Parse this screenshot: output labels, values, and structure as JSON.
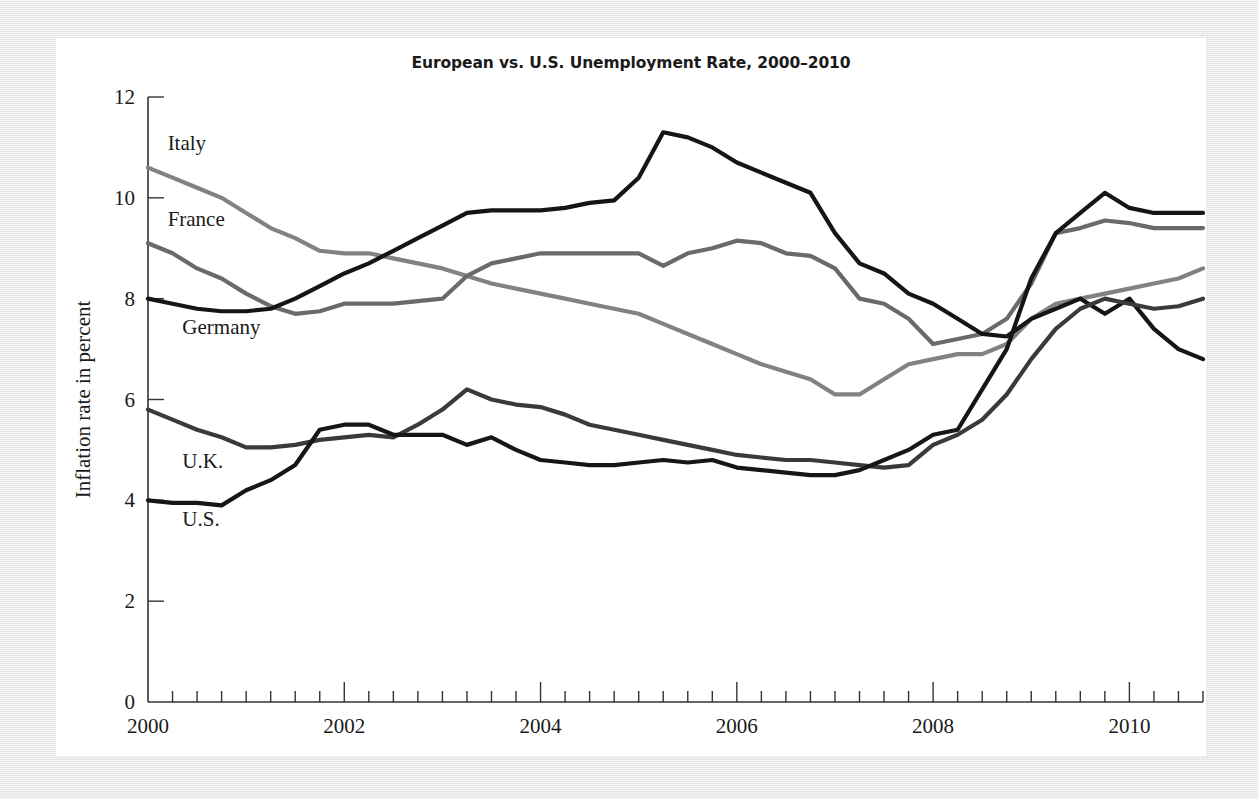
{
  "chart_data": {
    "type": "line",
    "title": "European vs. U.S. Unemployment Rate, 2000–2010",
    "xlabel": "",
    "ylabel": "Inflation rate in percent",
    "xlim": [
      2000,
      2010.75
    ],
    "ylim": [
      0,
      12
    ],
    "xticks": [
      2000,
      2002,
      2004,
      2006,
      2008,
      2010
    ],
    "xtick_labels": [
      "2000",
      "2002",
      "2004",
      "2006",
      "2008",
      "2010"
    ],
    "yticks": [
      0,
      2,
      4,
      6,
      8,
      10,
      12
    ],
    "ytick_labels": [
      "0",
      "2",
      "4",
      "6",
      "8",
      "10",
      "12"
    ],
    "minor_xtick_interval": 0.25,
    "grid": false,
    "legend_position": "inline-labels-left",
    "x": [
      2000.0,
      2000.25,
      2000.5,
      2000.75,
      2001.0,
      2001.25,
      2001.5,
      2001.75,
      2002.0,
      2002.25,
      2002.5,
      2002.75,
      2003.0,
      2003.25,
      2003.5,
      2003.75,
      2004.0,
      2004.25,
      2004.5,
      2004.75,
      2005.0,
      2005.25,
      2005.5,
      2005.75,
      2006.0,
      2006.25,
      2006.5,
      2006.75,
      2007.0,
      2007.25,
      2007.5,
      2007.75,
      2008.0,
      2008.25,
      2008.5,
      2008.75,
      2009.0,
      2009.25,
      2009.5,
      2009.75,
      2010.0,
      2010.25,
      2010.5,
      2010.75
    ],
    "series": [
      {
        "name": "Italy",
        "color": "#828282",
        "label_x": 2000.2,
        "label_y": 10.95,
        "values": [
          10.6,
          10.4,
          10.2,
          10.0,
          9.7,
          9.4,
          9.2,
          8.95,
          8.9,
          8.9,
          8.8,
          8.7,
          8.6,
          8.45,
          8.3,
          8.2,
          8.1,
          8.0,
          7.9,
          7.8,
          7.7,
          7.5,
          7.3,
          7.1,
          6.9,
          6.7,
          6.55,
          6.4,
          6.1,
          6.1,
          6.4,
          6.7,
          6.8,
          6.9,
          6.9,
          7.1,
          7.6,
          7.9,
          8.0,
          8.1,
          8.2,
          8.3,
          8.4,
          8.6
        ]
      },
      {
        "name": "France",
        "color": "#6a6a6a",
        "label_x": 2000.2,
        "label_y": 9.45,
        "values": [
          9.1,
          8.9,
          8.6,
          8.4,
          8.1,
          7.85,
          7.7,
          7.75,
          7.9,
          7.9,
          7.9,
          7.95,
          8.0,
          8.45,
          8.7,
          8.8,
          8.9,
          8.9,
          8.9,
          8.9,
          8.9,
          8.65,
          8.9,
          9.0,
          9.15,
          9.1,
          8.9,
          8.85,
          8.6,
          8.0,
          7.9,
          7.6,
          7.1,
          7.2,
          7.3,
          7.6,
          8.3,
          9.3,
          9.4,
          9.55,
          9.5,
          9.4,
          9.4,
          9.4
        ]
      },
      {
        "name": "Germany",
        "color": "#151515",
        "label_x": 2000.35,
        "label_y": 7.3,
        "values": [
          8.0,
          7.9,
          7.8,
          7.75,
          7.75,
          7.8,
          8.0,
          8.25,
          8.5,
          8.7,
          8.95,
          9.2,
          9.45,
          9.7,
          9.75,
          9.75,
          9.75,
          9.8,
          9.9,
          9.95,
          10.4,
          11.3,
          11.2,
          11.0,
          10.7,
          10.5,
          10.3,
          10.1,
          9.3,
          8.7,
          8.5,
          8.1,
          7.9,
          7.6,
          7.3,
          7.25,
          7.6,
          7.8,
          8.0,
          7.7,
          8.0,
          7.4,
          7.0,
          6.8
        ]
      },
      {
        "name": "U.K.",
        "color": "#3a3a3a",
        "label_x": 2000.35,
        "label_y": 4.65,
        "values": [
          5.8,
          5.6,
          5.4,
          5.25,
          5.05,
          5.05,
          5.1,
          5.2,
          5.25,
          5.3,
          5.25,
          5.5,
          5.8,
          6.2,
          6.0,
          5.9,
          5.85,
          5.7,
          5.5,
          5.4,
          5.3,
          5.2,
          5.1,
          5.0,
          4.9,
          4.85,
          4.8,
          4.8,
          4.75,
          4.7,
          4.65,
          4.7,
          5.1,
          5.3,
          5.6,
          6.1,
          6.8,
          7.4,
          7.8,
          8.0,
          7.9,
          7.8,
          7.85,
          8.0
        ]
      },
      {
        "name": "U.S.",
        "color": "#161616",
        "label_x": 2000.35,
        "label_y": 3.5,
        "values": [
          4.0,
          3.95,
          3.95,
          3.9,
          4.2,
          4.4,
          4.7,
          5.4,
          5.5,
          5.5,
          5.3,
          5.3,
          5.3,
          5.1,
          5.25,
          5.0,
          4.8,
          4.75,
          4.7,
          4.7,
          4.75,
          4.8,
          4.75,
          4.8,
          4.65,
          4.6,
          4.55,
          4.5,
          4.5,
          4.6,
          4.8,
          5.0,
          5.3,
          5.4,
          6.2,
          7.0,
          8.4,
          9.3,
          9.7,
          10.1,
          9.8,
          9.7,
          9.7,
          9.7
        ]
      }
    ]
  },
  "axis_label_text": "Inflation rate in percent"
}
